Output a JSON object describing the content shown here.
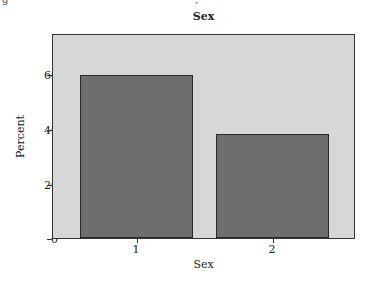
{
  "chart_data": {
    "type": "bar",
    "title": "Sex",
    "xlabel": "Sex",
    "ylabel": "Percent",
    "categories": [
      "1",
      "2"
    ],
    "values": [
      60.2,
      38.6
    ],
    "ylim": [
      0,
      75
    ],
    "yticks": [
      0,
      20,
      40,
      60
    ],
    "grid": false,
    "legend": null,
    "colors": {
      "bar": "#6e6e6e",
      "bar_border": "#2a2a2a",
      "plot_bg": "#d7d7d7"
    }
  },
  "labels": {
    "title": "Sex",
    "xlabel": "Sex",
    "ylabel": "Percent",
    "yticks": [
      "0",
      "20",
      "40",
      "60"
    ],
    "xticks": [
      "1",
      "2"
    ]
  }
}
